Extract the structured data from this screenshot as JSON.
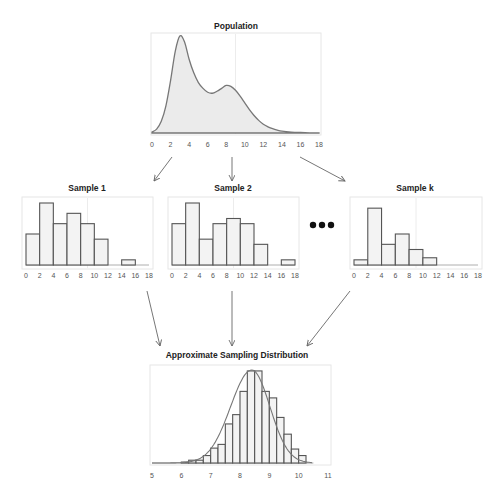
{
  "diagram": {
    "population": {
      "title": "Population",
      "x_ticks": [
        "0",
        "2",
        "4",
        "6",
        "8",
        "10",
        "12",
        "14",
        "16",
        "18"
      ]
    },
    "samples": [
      {
        "title": "Sample 1",
        "x_ticks": [
          "0",
          "2",
          "4",
          "6",
          "8",
          "10",
          "12",
          "14",
          "16",
          "18"
        ]
      },
      {
        "title": "Sample 2",
        "x_ticks": [
          "0",
          "2",
          "4",
          "6",
          "8",
          "10",
          "12",
          "14",
          "16",
          "18"
        ]
      },
      {
        "title": "Sample k",
        "x_ticks": [
          "0",
          "2",
          "4",
          "6",
          "8",
          "10",
          "12",
          "14",
          "16",
          "18"
        ]
      }
    ],
    "ellipsis": "•••",
    "sampling_distribution": {
      "title": "Approximate Sampling Distribution",
      "x_ticks": [
        "5",
        "6",
        "7",
        "8",
        "9",
        "10",
        "11"
      ]
    },
    "colors": {
      "bar_fill": "#f3f3f3",
      "bar_stroke": "#555555",
      "curve_fill": "#ebebeb",
      "curve_stroke": "#777777",
      "arrow": "#666666"
    }
  },
  "chart_data": [
    {
      "type": "area",
      "title": "Population",
      "xlabel": "",
      "ylabel": "",
      "xlim": [
        0,
        18
      ],
      "x": [
        0,
        0.5,
        1,
        1.5,
        2,
        2.5,
        3,
        3.5,
        4,
        4.5,
        5,
        5.5,
        6,
        6.5,
        7,
        7.5,
        8,
        8.5,
        9,
        9.5,
        10,
        10.5,
        11,
        11.5,
        12,
        12.5,
        13,
        13.5,
        14,
        15,
        16,
        17,
        18
      ],
      "y": [
        0.5,
        2,
        6,
        14,
        27,
        42,
        50,
        47,
        38,
        31,
        26,
        23,
        21,
        20.5,
        21.5,
        23,
        24.5,
        24,
        22,
        19,
        15.5,
        12,
        9,
        6.5,
        4.5,
        3.2,
        2.2,
        1.5,
        1.0,
        0.5,
        0.25,
        0.1,
        0.05
      ],
      "grid": false
    },
    {
      "type": "bar",
      "title": "Sample 1",
      "categories": [
        "0-2",
        "2-4",
        "4-6",
        "6-8",
        "8-10",
        "10-12",
        "12-14",
        "14-16",
        "16-18"
      ],
      "values": [
        6,
        12,
        8,
        10,
        8,
        5,
        0,
        1,
        0
      ],
      "xlim": [
        0,
        18
      ]
    },
    {
      "type": "bar",
      "title": "Sample 2",
      "categories": [
        "0-2",
        "2-4",
        "4-6",
        "6-8",
        "8-10",
        "10-12",
        "12-14",
        "14-16",
        "16-18"
      ],
      "values": [
        8,
        12,
        5,
        8,
        9,
        8,
        4,
        0,
        1
      ],
      "xlim": [
        0,
        18
      ]
    },
    {
      "type": "bar",
      "title": "Sample k",
      "categories": [
        "0-2",
        "2-4",
        "4-6",
        "6-8",
        "8-10",
        "10-12",
        "12-14",
        "14-16",
        "16-18"
      ],
      "values": [
        1,
        11,
        4,
        6,
        3,
        1.4,
        0,
        0,
        0
      ],
      "xlim": [
        0,
        18
      ]
    },
    {
      "type": "bar",
      "title": "Approximate Sampling Distribution",
      "bin_width": 0.25,
      "categories": [
        "6.0",
        "6.25",
        "6.5",
        "6.75",
        "7.0",
        "7.25",
        "7.5",
        "7.75",
        "8.0",
        "8.25",
        "8.5",
        "8.75",
        "9.0",
        "9.25",
        "9.5",
        "9.75",
        "10.0"
      ],
      "values": [
        1,
        3,
        3,
        8,
        16,
        20,
        42,
        52,
        77,
        99,
        99,
        77,
        70,
        49,
        31,
        15,
        8
      ],
      "overlay_curve": "normal-like density curve",
      "xlim": [
        5,
        11
      ]
    }
  ]
}
